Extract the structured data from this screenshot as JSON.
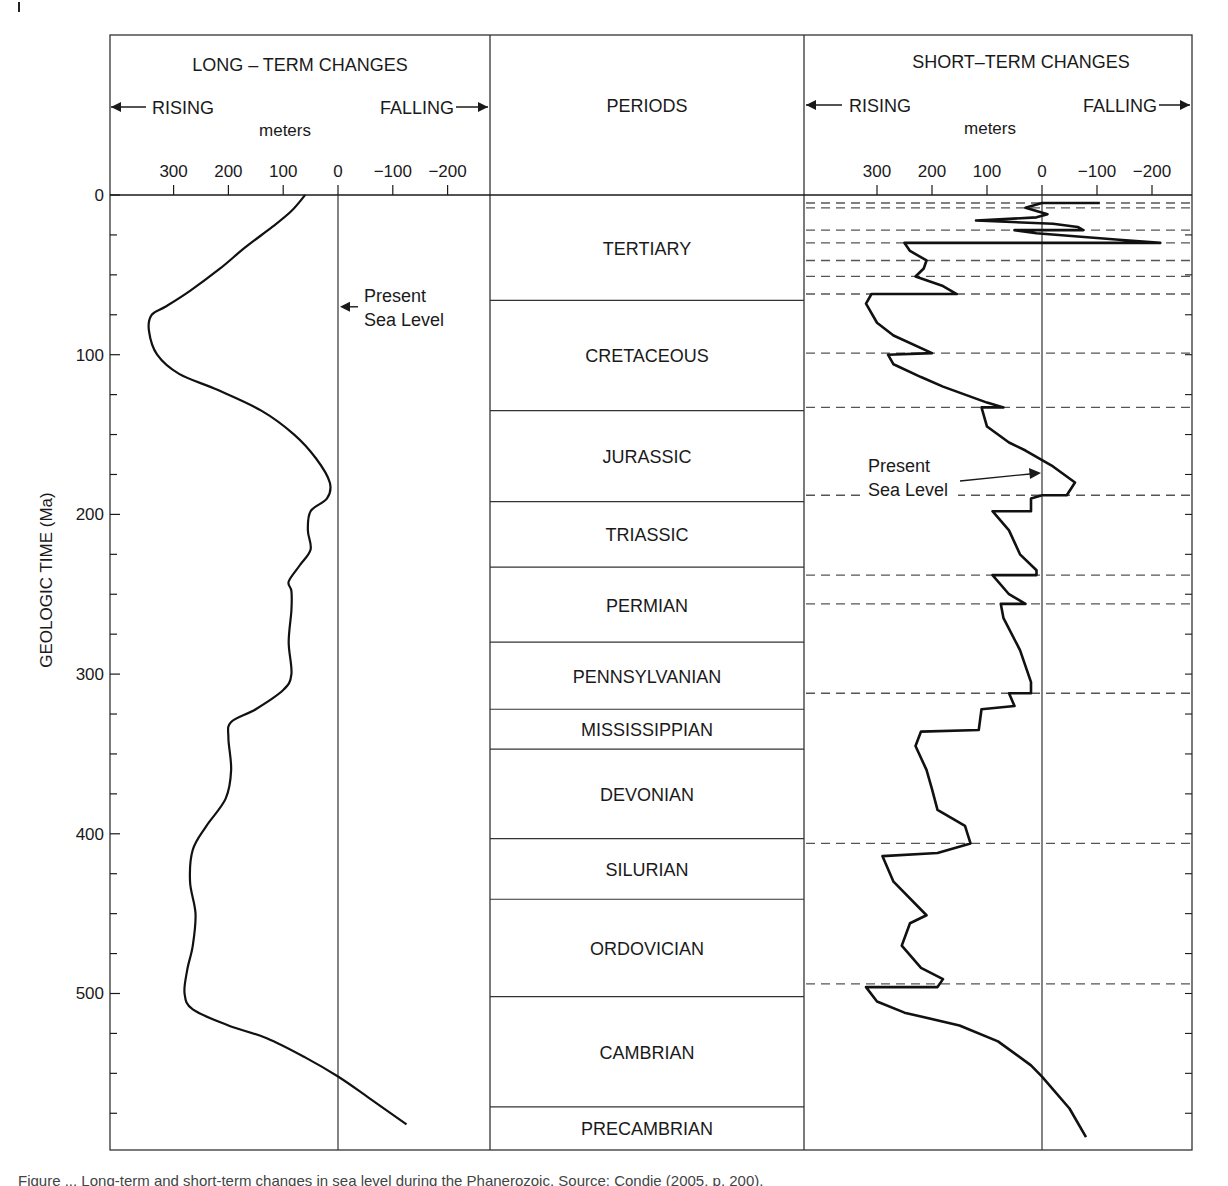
{
  "chart_data": {
    "type": "line",
    "title": "Long-term and short-term changes in sea level during the Phanerozoic",
    "ylabel": "GEOLOGIC TIME (Ma)",
    "y_ticks": [
      0,
      100,
      200,
      300,
      400,
      500
    ],
    "ylim": [
      0,
      598
    ],
    "y_inverted": true,
    "panels": [
      {
        "id": "long_term",
        "title": "LONG – TERM CHANGES",
        "rising_label": "RISING",
        "falling_label": "FALLING",
        "xlabel": "meters",
        "x_ticks": [
          300,
          200,
          100,
          0,
          -100,
          -200
        ],
        "x_tick_labels": [
          "300",
          "200",
          "100",
          "0",
          "−100",
          "−200"
        ],
        "xlim": [
          300,
          -200
        ],
        "annotation": {
          "text_lines": [
            "Present",
            "Sea Level"
          ],
          "points_to_x": 0,
          "at_ma": 70
        },
        "series": [
          {
            "name": "Long-term sea level",
            "points": [
              [
                60,
                0
              ],
              [
                85,
                10
              ],
              [
                120,
                20
              ],
              [
                170,
                33
              ],
              [
                215,
                46
              ],
              [
                270,
                60
              ],
              [
                315,
                70
              ],
              [
                340,
                75
              ],
              [
                345,
                85
              ],
              [
                330,
                100
              ],
              [
                290,
                112
              ],
              [
                220,
                122
              ],
              [
                140,
                135
              ],
              [
                80,
                150
              ],
              [
                40,
                165
              ],
              [
                15,
                180
              ],
              [
                20,
                190
              ],
              [
                50,
                198
              ],
              [
                55,
                210
              ],
              [
                50,
                222
              ],
              [
                70,
                232
              ],
              [
                90,
                242
              ],
              [
                85,
                248
              ],
              [
                85,
                260
              ],
              [
                90,
                280
              ],
              [
                85,
                300
              ],
              [
                100,
                310
              ],
              [
                150,
                322
              ],
              [
                195,
                330
              ],
              [
                200,
                340
              ],
              [
                195,
                360
              ],
              [
                205,
                378
              ],
              [
                240,
                395
              ],
              [
                265,
                410
              ],
              [
                270,
                430
              ],
              [
                260,
                450
              ],
              [
                265,
                470
              ],
              [
                275,
                485
              ],
              [
                280,
                500
              ],
              [
                265,
                510
              ],
              [
                200,
                520
              ],
              [
                130,
                528
              ],
              [
                60,
                540
              ],
              [
                0,
                552
              ],
              [
                -55,
                565
              ],
              [
                -125,
                582
              ]
            ]
          }
        ]
      },
      {
        "id": "short_term",
        "title": "SHORT–TERM CHANGES",
        "rising_label": "RISING",
        "falling_label": "FALLING",
        "xlabel": "meters",
        "x_ticks": [
          300,
          200,
          100,
          0,
          -100,
          -200
        ],
        "x_tick_labels": [
          "300",
          "200",
          "100",
          "0",
          "−100",
          "−200"
        ],
        "xlim": [
          300,
          -200
        ],
        "annotation": {
          "text_lines": [
            "Present",
            "Sea Level"
          ],
          "points_to_x": 0,
          "at_ma": 175
        },
        "dashed_boundaries_ma": [
          5,
          8,
          22,
          30,
          41,
          51,
          62,
          99,
          133,
          188,
          238,
          256,
          312,
          406,
          494
        ],
        "series": [
          {
            "name": "Short-term sea level",
            "points": [
              [
                -105,
                5
              ],
              [
                0,
                5
              ],
              [
                30,
                8
              ],
              [
                10,
                10
              ],
              [
                -10,
                12
              ],
              [
                10,
                14
              ],
              [
                120,
                16
              ],
              [
                -20,
                18
              ],
              [
                -65,
                20
              ],
              [
                -75,
                22
              ],
              [
                50,
                22
              ],
              [
                10,
                24
              ],
              [
                -140,
                28
              ],
              [
                -215,
                30
              ],
              [
                250,
                30
              ],
              [
                240,
                35
              ],
              [
                210,
                41
              ],
              [
                215,
                46
              ],
              [
                230,
                51
              ],
              [
                180,
                57
              ],
              [
                155,
                62
              ],
              [
                310,
                62
              ],
              [
                320,
                68
              ],
              [
                300,
                80
              ],
              [
                270,
                88
              ],
              [
                200,
                99
              ],
              [
                280,
                100
              ],
              [
                270,
                106
              ],
              [
                220,
                114
              ],
              [
                180,
                120
              ],
              [
                140,
                125
              ],
              [
                100,
                130
              ],
              [
                70,
                133
              ],
              [
                110,
                133
              ],
              [
                100,
                145
              ],
              [
                60,
                155
              ],
              [
                30,
                160
              ],
              [
                -20,
                170
              ],
              [
                -60,
                180
              ],
              [
                -45,
                188
              ],
              [
                0,
                188
              ],
              [
                20,
                190
              ],
              [
                20,
                198
              ],
              [
                90,
                198
              ],
              [
                60,
                210
              ],
              [
                40,
                225
              ],
              [
                10,
                235
              ],
              [
                10,
                238
              ],
              [
                90,
                238
              ],
              [
                60,
                250
              ],
              [
                30,
                256
              ],
              [
                75,
                256
              ],
              [
                70,
                265
              ],
              [
                40,
                285
              ],
              [
                20,
                305
              ],
              [
                20,
                312
              ],
              [
                60,
                312
              ],
              [
                50,
                320
              ],
              [
                110,
                322
              ],
              [
                115,
                335
              ],
              [
                220,
                336
              ],
              [
                230,
                345
              ],
              [
                210,
                360
              ],
              [
                200,
                372
              ],
              [
                190,
                385
              ],
              [
                140,
                395
              ],
              [
                130,
                406
              ],
              [
                190,
                412
              ],
              [
                290,
                414
              ],
              [
                270,
                430
              ],
              [
                210,
                451
              ],
              [
                240,
                456
              ],
              [
                255,
                470
              ],
              [
                220,
                484
              ],
              [
                180,
                491
              ],
              [
                190,
                496
              ],
              [
                320,
                496
              ],
              [
                300,
                505
              ],
              [
                250,
                512
              ],
              [
                150,
                520
              ],
              [
                80,
                530
              ],
              [
                20,
                545
              ],
              [
                0,
                552
              ],
              [
                -50,
                572
              ],
              [
                -80,
                590
              ]
            ]
          }
        ]
      }
    ],
    "periods": [
      {
        "name": "TERTIARY",
        "start_ma": 0,
        "end_ma": 66
      },
      {
        "name": "CRETACEOUS",
        "start_ma": 66,
        "end_ma": 135
      },
      {
        "name": "JURASSIC",
        "start_ma": 135,
        "end_ma": 192
      },
      {
        "name": "TRIASSIC",
        "start_ma": 192,
        "end_ma": 233
      },
      {
        "name": "PERMIAN",
        "start_ma": 233,
        "end_ma": 280
      },
      {
        "name": "PENNSYLVANIAN",
        "start_ma": 280,
        "end_ma": 322
      },
      {
        "name": "MISSISSIPPIAN",
        "start_ma": 322,
        "end_ma": 347
      },
      {
        "name": "DEVONIAN",
        "start_ma": 347,
        "end_ma": 403
      },
      {
        "name": "SILURIAN",
        "start_ma": 403,
        "end_ma": 441
      },
      {
        "name": "ORDOVICIAN",
        "start_ma": 441,
        "end_ma": 502
      },
      {
        "name": "CAMBRIAN",
        "start_ma": 502,
        "end_ma": 571
      },
      {
        "name": "PRECAMBRIAN",
        "start_ma": 571,
        "end_ma": 598
      }
    ],
    "grid": false,
    "legend": null
  },
  "header": {
    "long_title": "LONG – TERM CHANGES",
    "periods_title": "PERIODS",
    "short_title": "SHORT–TERM CHANGES",
    "rising": "RISING",
    "falling": "FALLING",
    "meters": "meters"
  },
  "annotations": {
    "present": "Present",
    "sea_level": "Sea Level"
  },
  "caption": "Figure ... Long-term and short-term changes in sea level during the Phanerozoic. Source: Condie (2005, p. 200)."
}
